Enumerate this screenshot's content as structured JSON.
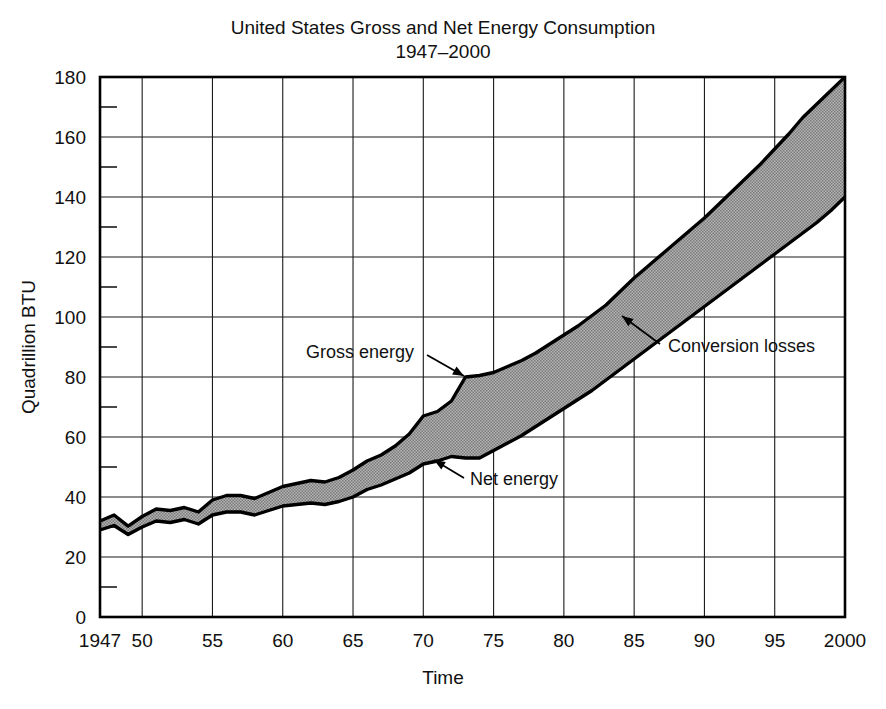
{
  "chart_data": {
    "type": "area",
    "title": "United States Gross and Net Energy Consumption",
    "subtitle": "1947–2000",
    "xlabel": "Time",
    "ylabel": "Quadrillion BTU",
    "xlim": [
      1947,
      2000
    ],
    "ylim": [
      0,
      180
    ],
    "grid": true,
    "legend_position": "inline-annotations",
    "y_ticks_major": [
      0,
      20,
      40,
      60,
      80,
      100,
      120,
      140,
      160,
      180
    ],
    "y_ticks_minor": [
      10,
      30,
      50,
      70,
      90,
      110,
      130,
      150,
      170
    ],
    "x_tick_values": [
      1947,
      1950,
      1955,
      1960,
      1965,
      1970,
      1975,
      1980,
      1985,
      1990,
      1995,
      2000
    ],
    "x_tick_labels": [
      "1947",
      "50",
      "55",
      "60",
      "65",
      "70",
      "75",
      "80",
      "85",
      "90",
      "95",
      "2000"
    ],
    "x": [
      1947,
      1948,
      1949,
      1950,
      1951,
      1952,
      1953,
      1954,
      1955,
      1956,
      1957,
      1958,
      1959,
      1960,
      1961,
      1962,
      1963,
      1964,
      1965,
      1966,
      1967,
      1968,
      1969,
      1970,
      1971,
      1972,
      1973,
      1974,
      1975,
      1976,
      1977,
      1978,
      1979,
      1980,
      1981,
      1982,
      1983,
      1984,
      1985,
      1986,
      1987,
      1988,
      1989,
      1990,
      1991,
      1992,
      1993,
      1994,
      1995,
      1996,
      1997,
      1998,
      1999,
      2000
    ],
    "series": [
      {
        "name": "Gross energy",
        "fill": "none",
        "values": [
          32.0,
          34.0,
          30.3,
          33.5,
          36.0,
          35.5,
          36.5,
          35.0,
          39.0,
          40.5,
          40.5,
          39.5,
          41.5,
          43.5,
          44.5,
          45.5,
          45.0,
          46.5,
          49.0,
          52.0,
          54.0,
          57.0,
          61.0,
          67.0,
          68.5,
          72.0,
          80.0,
          80.5,
          81.5,
          83.5,
          85.5,
          88.0,
          91.0,
          94.0,
          97.0,
          100.5,
          104.0,
          108.5,
          113.0,
          117.0,
          121.0,
          125.0,
          129.0,
          133.0,
          137.5,
          142.0,
          146.5,
          151.0,
          156.0,
          161.0,
          166.5,
          171.0,
          175.5,
          180.0
        ]
      },
      {
        "name": "Net energy",
        "fill": "none",
        "values": [
          29.0,
          30.5,
          27.5,
          30.0,
          32.0,
          31.5,
          32.5,
          31.0,
          34.0,
          35.0,
          35.0,
          34.0,
          35.5,
          37.0,
          37.5,
          38.0,
          37.5,
          38.5,
          40.0,
          42.5,
          44.0,
          46.0,
          48.0,
          51.0,
          52.0,
          53.5,
          53.0,
          53.0,
          55.5,
          58.0,
          60.5,
          63.5,
          66.5,
          69.5,
          72.5,
          75.5,
          79.0,
          82.5,
          86.0,
          89.5,
          93.0,
          96.5,
          100.0,
          103.5,
          107.0,
          110.5,
          114.0,
          117.5,
          121.0,
          124.5,
          128.0,
          131.5,
          135.5,
          140.0
        ]
      }
    ],
    "band": {
      "name": "Conversion losses",
      "upper_series": "Gross energy",
      "lower_series": "Net energy",
      "fill_color": "#9a9a9a"
    },
    "annotations": [
      {
        "id": "gross-energy",
        "label": "Gross energy",
        "text_x": 306,
        "text_y": 358,
        "arrow_from_x": 427,
        "arrow_from_y": 355,
        "arrow_to_x": 464,
        "arrow_to_y": 376
      },
      {
        "id": "net-energy",
        "label": "Net energy",
        "text_x": 470,
        "text_y": 485,
        "arrow_from_x": 464,
        "arrow_from_y": 478,
        "arrow_to_x": 434,
        "arrow_to_y": 460
      },
      {
        "id": "conversion-losses",
        "label": "Conversion losses",
        "text_x": 668,
        "text_y": 352,
        "arrow_from_x": 660,
        "arrow_from_y": 344,
        "arrow_to_x": 622,
        "arrow_to_y": 316
      }
    ]
  }
}
